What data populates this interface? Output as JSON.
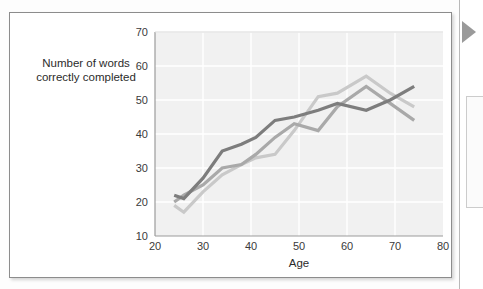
{
  "page": {
    "background_color": "#fdfdfd",
    "card_border_color": "#8c8c8c",
    "edge_marker_icon": "right-triangle-marker-icon"
  },
  "chart_data": {
    "type": "line",
    "title": "",
    "xlabel": "Age",
    "ylabel": "Number of words correctly completed",
    "ylabel_line1": "Number of words",
    "ylabel_line2": "correctly completed",
    "xlim": [
      20,
      80
    ],
    "ylim": [
      10,
      70
    ],
    "xticks": [
      20,
      30,
      40,
      50,
      60,
      70,
      80
    ],
    "yticks": [
      10,
      20,
      30,
      40,
      50,
      60,
      70
    ],
    "grid": true,
    "grid_color": "#ffffff",
    "plot_background": "#f1f1f1",
    "legend": "none",
    "series": [
      {
        "name": "Series 1 (dark gray)",
        "color": "#7d7d7d",
        "x": [
          24,
          26,
          30,
          34,
          38,
          41,
          45,
          49,
          54,
          58,
          64,
          69,
          74
        ],
        "values": [
          22,
          21,
          27,
          35,
          37,
          39,
          44,
          45,
          47,
          49,
          47,
          50,
          54
        ]
      },
      {
        "name": "Series 2 (medium gray)",
        "color": "#a9a9a9",
        "x": [
          24,
          26,
          30,
          34,
          38,
          41,
          45,
          49,
          54,
          58,
          64,
          69,
          74
        ],
        "values": [
          20,
          22,
          25,
          30,
          31,
          34,
          39,
          43,
          41,
          48,
          54,
          49,
          44
        ]
      },
      {
        "name": "Series 3 (light gray)",
        "color": "#c9c9c9",
        "x": [
          24,
          26,
          30,
          34,
          38,
          41,
          45,
          49,
          54,
          58,
          64,
          69,
          74
        ],
        "values": [
          19,
          17,
          23,
          28,
          31,
          33,
          34,
          41,
          51,
          52,
          57,
          52,
          48
        ]
      }
    ]
  }
}
